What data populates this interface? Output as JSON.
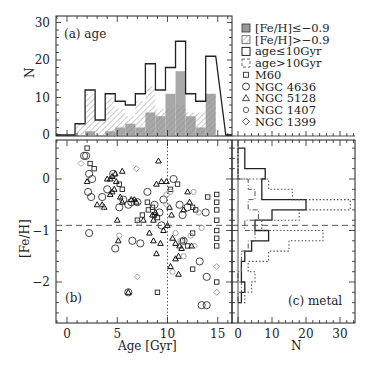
{
  "figure": {
    "panels": {
      "a": {
        "label": "(a) age",
        "ylabel": "N"
      },
      "b": {
        "label": "(b)",
        "xlabel": "Age [Gyr]",
        "ylabel": "[Fe/H]"
      },
      "c": {
        "label": "(c) metal",
        "xlabel": "N"
      }
    },
    "legend": [
      {
        "symbol": "filled-gray-square",
        "label": "[Fe/H]≤−0.9"
      },
      {
        "symbol": "hatched-square",
        "label": "[Fe/H]>−0.9"
      },
      {
        "symbol": "solid-open-square",
        "label": "age≤10Gyr"
      },
      {
        "symbol": "dashed-open-square",
        "label": "age>10Gyr"
      },
      {
        "symbol": "small-square",
        "label": "M60"
      },
      {
        "symbol": "circle",
        "label": "NGC 4636"
      },
      {
        "symbol": "triangle",
        "label": "NGC 5128"
      },
      {
        "symbol": "small-circle",
        "label": "NGC 1407"
      },
      {
        "symbol": "diamond",
        "label": "NGC 1399"
      }
    ],
    "ticks": {
      "a_y": [
        "0",
        "10",
        "20",
        "30"
      ],
      "b_x": [
        "0",
        "5",
        "10",
        "15"
      ],
      "b_y": [
        "0",
        "−1",
        "−2"
      ],
      "c_x": [
        "0",
        "10",
        "20",
        "30"
      ]
    },
    "colors": {
      "ink": "#222222",
      "gray_fill": "#9a9a9a",
      "hatch": "#8a8a8a",
      "faint": "#888888"
    }
  },
  "chart_data": [
    {
      "type": "bar",
      "title": "(a) age",
      "xlabel": "Age [Gyr]",
      "ylabel": "N",
      "ylim": [
        0,
        30
      ],
      "xlim": [
        -1.1,
        16.5
      ],
      "bin_edges": [
        0.8,
        1.8,
        2.8,
        3.8,
        4.8,
        5.8,
        6.8,
        7.8,
        8.8,
        9.8,
        10.8,
        11.8,
        12.8,
        13.8,
        14.8
      ],
      "series": [
        {
          "name": "All (outline)",
          "values": [
            3,
            12,
            4,
            11,
            9,
            8,
            11,
            19,
            12,
            18,
            25,
            11,
            9,
            21
          ]
        },
        {
          "name": "[Fe/H]>-0.9 (hatched)",
          "values": [
            3,
            11,
            4,
            10,
            7,
            5,
            9,
            13,
            7,
            7,
            8,
            6,
            6,
            11
          ]
        },
        {
          "name": "[Fe/H]<=-0.9 (gray)",
          "values": [
            0,
            1,
            0,
            1,
            2,
            3,
            2,
            6,
            5,
            11,
            17,
            5,
            2,
            11
          ]
        }
      ]
    },
    {
      "type": "scatter",
      "title": "(b)",
      "xlabel": "Age [Gyr]",
      "ylabel": "[Fe/H]",
      "xlim": [
        -1.1,
        16.5
      ],
      "ylim": [
        -2.8,
        0.75
      ],
      "reference_lines": {
        "horizontal_feh": -0.9,
        "vertical_age": 10
      },
      "series": [
        {
          "name": "M60",
          "marker": "small-square",
          "points": [
            [
              2.0,
              0.6
            ],
            [
              2.3,
              0.3
            ],
            [
              2.7,
              0.2
            ],
            [
              5.2,
              -0.1
            ],
            [
              5.5,
              -0.2
            ],
            [
              7.0,
              -0.8
            ],
            [
              7.5,
              -0.7
            ],
            [
              8.0,
              -0.45
            ],
            [
              8.1,
              -0.6
            ],
            [
              8.5,
              -0.55
            ],
            [
              8.7,
              -0.7
            ],
            [
              9.0,
              -0.75
            ],
            [
              10.3,
              -0.2
            ],
            [
              11.0,
              -0.1
            ],
            [
              12.5,
              -0.55
            ],
            [
              12.8,
              -0.6
            ],
            [
              14.0,
              -0.35
            ],
            [
              14.9,
              -0.3
            ],
            [
              14.9,
              -0.45
            ],
            [
              14.9,
              -0.6
            ],
            [
              14.9,
              -0.8
            ],
            [
              14.9,
              -1.0
            ],
            [
              14.9,
              -1.15
            ],
            [
              14.9,
              -1.3
            ],
            [
              14.9,
              -2.0
            ],
            [
              12.5,
              -1.05
            ],
            [
              12.0,
              -1.3
            ],
            [
              12.5,
              -1.75
            ],
            [
              9.0,
              -2.2
            ],
            [
              11.5,
              -1.2
            ]
          ]
        },
        {
          "name": "NGC 4636",
          "marker": "circle",
          "points": [
            [
              1.7,
              0.45
            ],
            [
              1.9,
              0.45
            ],
            [
              2.2,
              0.1
            ],
            [
              2.5,
              0.0
            ],
            [
              2.1,
              -0.25
            ],
            [
              2.4,
              -0.35
            ],
            [
              3.5,
              -0.35
            ],
            [
              4.0,
              -0.2
            ],
            [
              4.6,
              0.1
            ],
            [
              5.2,
              -0.55
            ],
            [
              5.6,
              -0.4
            ],
            [
              6.1,
              -0.5
            ],
            [
              6.4,
              -0.45
            ],
            [
              7.0,
              -0.45
            ],
            [
              8.0,
              -0.25
            ],
            [
              8.7,
              -0.5
            ],
            [
              9.2,
              -0.65
            ],
            [
              9.6,
              -0.4
            ],
            [
              10.6,
              0.0
            ],
            [
              11.2,
              -0.5
            ],
            [
              11.5,
              -0.7
            ],
            [
              12.0,
              -0.55
            ],
            [
              13.8,
              -0.65
            ],
            [
              2.2,
              -1.05
            ],
            [
              4.8,
              -1.35
            ],
            [
              6.5,
              -1.2
            ],
            [
              7.3,
              -1.25
            ],
            [
              9.4,
              -0.9
            ],
            [
              11.6,
              -1.2
            ],
            [
              13.2,
              -1.6
            ],
            [
              13.9,
              -1.9
            ],
            [
              13.4,
              -2.45
            ],
            [
              13.9,
              -2.45
            ],
            [
              6.1,
              -2.2
            ]
          ]
        },
        {
          "name": "NGC 5128",
          "marker": "triangle",
          "points": [
            [
              2.0,
              -0.05
            ],
            [
              3.0,
              -0.5
            ],
            [
              3.5,
              -0.5
            ],
            [
              3.7,
              -0.55
            ],
            [
              4.0,
              0.0
            ],
            [
              4.3,
              0.0
            ],
            [
              4.5,
              0.05
            ],
            [
              4.8,
              0.1
            ],
            [
              4.9,
              -0.05
            ],
            [
              5.5,
              -0.45
            ],
            [
              4.3,
              -0.3
            ],
            [
              4.5,
              -0.25
            ],
            [
              4.7,
              -0.2
            ],
            [
              5.3,
              -0.35
            ],
            [
              5.5,
              0.15
            ],
            [
              6.4,
              -0.4
            ],
            [
              6.7,
              -0.4
            ],
            [
              6.9,
              -0.45
            ],
            [
              8.5,
              -0.7
            ],
            [
              8.6,
              -0.8
            ],
            [
              8.8,
              -0.65
            ],
            [
              8.9,
              -0.1
            ],
            [
              9.1,
              0.35
            ],
            [
              9.4,
              -0.05
            ],
            [
              9.9,
              -0.05
            ],
            [
              7.6,
              -0.8
            ],
            [
              8.2,
              -1.05
            ],
            [
              8.6,
              -1.2
            ],
            [
              8.9,
              -1.45
            ],
            [
              9.3,
              -1.25
            ],
            [
              9.6,
              -1.0
            ],
            [
              10.0,
              -0.9
            ],
            [
              10.2,
              -0.55
            ],
            [
              10.4,
              -0.7
            ],
            [
              10.5,
              -1.15
            ],
            [
              10.8,
              -1.25
            ],
            [
              10.8,
              -1.55
            ],
            [
              11.1,
              -1.5
            ],
            [
              11.2,
              -1.3
            ],
            [
              11.4,
              -1.35
            ],
            [
              11.6,
              -0.6
            ],
            [
              12.0,
              -0.25
            ],
            [
              12.2,
              -0.45
            ],
            [
              12.4,
              -1.3
            ],
            [
              11.1,
              -1.85
            ],
            [
              10.3,
              -1.7
            ],
            [
              5.0,
              -0.8
            ],
            [
              5.1,
              -1.2
            ],
            [
              6.1,
              -2.2
            ]
          ]
        },
        {
          "name": "NGC 1407",
          "marker": "small-circle",
          "points": [
            [
              3.5,
              -0.55
            ],
            [
              5.2,
              -1.1
            ],
            [
              7.2,
              -0.85
            ],
            [
              9.9,
              -0.3
            ],
            [
              10.3,
              -0.25
            ],
            [
              10.8,
              -1.05
            ],
            [
              11.3,
              -1.2
            ],
            [
              11.6,
              -1.5
            ],
            [
              12.3,
              -1.1
            ],
            [
              12.6,
              -0.25
            ],
            [
              13.1,
              -0.65
            ],
            [
              13.4,
              -0.95
            ],
            [
              10.5,
              -1.8
            ]
          ]
        },
        {
          "name": "NGC 1399",
          "marker": "diamond",
          "points": [
            [
              1.4,
              0.3
            ],
            [
              6.9,
              0.2
            ],
            [
              7.0,
              -1.9
            ],
            [
              12.7,
              -1.3
            ],
            [
              14.9,
              -1.7
            ],
            [
              14.9,
              -2.2
            ],
            [
              9.9,
              -0.5
            ]
          ]
        }
      ]
    },
    {
      "type": "bar",
      "orientation": "horizontal",
      "title": "(c) metal",
      "xlabel": "N",
      "xlim": [
        -2,
        34
      ],
      "ylim": [
        -2.8,
        0.75
      ],
      "bin_edges_feh": [
        0.6,
        0.4,
        0.2,
        0.0,
        -0.2,
        -0.4,
        -0.6,
        -0.8,
        -1.0,
        -1.2,
        -1.4,
        -1.6,
        -1.8,
        -2.0,
        -2.2,
        -2.4
      ],
      "series": [
        {
          "name": "age<=10Gyr (solid)",
          "values": [
            2,
            2,
            8,
            7,
            7,
            20,
            10,
            5,
            9,
            4,
            2,
            1,
            1,
            2,
            1
          ]
        },
        {
          "name": "age>10Gyr (dash-dot)",
          "values": [
            0,
            0,
            0,
            3,
            5,
            3,
            6,
            2,
            5,
            3,
            1,
            1,
            0,
            1,
            0
          ]
        },
        {
          "name": "total (dotted)",
          "values": [
            0,
            0,
            0,
            9,
            16,
            33,
            18,
            7,
            25,
            15,
            9,
            3,
            5,
            4,
            2
          ]
        }
      ]
    }
  ]
}
